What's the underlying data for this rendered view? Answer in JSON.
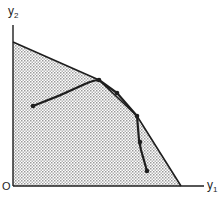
{
  "diagram": {
    "type": "feasible-region-path",
    "axes": {
      "x_label": "y",
      "x_label_sub": "1",
      "y_label": "y",
      "y_label_sub": "2",
      "origin_label": "O"
    },
    "colors": {
      "line": "#1e1e1e",
      "region_fill": "#d9d9d9",
      "background": "#ffffff"
    },
    "region": {
      "description": "Shaded feasible region bounded by axes and a concave frontier",
      "vertices": [
        [
          13,
          42
        ],
        [
          99,
          80
        ],
        [
          137,
          116
        ],
        [
          181,
          186
        ],
        [
          13,
          186
        ]
      ]
    },
    "path": {
      "description": "Iterative path moving to the frontier, along it, then back inside",
      "points": [
        [
          33,
          106
        ],
        [
          60,
          96
        ],
        [
          85,
          84
        ],
        [
          99,
          80
        ],
        [
          117,
          93
        ],
        [
          137,
          116
        ],
        [
          139,
          140
        ],
        [
          141,
          150
        ],
        [
          147,
          171
        ]
      ],
      "markers": [
        [
          33,
          106
        ],
        [
          99,
          80
        ],
        [
          117,
          93
        ],
        [
          137,
          116
        ],
        [
          140,
          142
        ],
        [
          147,
          171
        ]
      ]
    }
  }
}
